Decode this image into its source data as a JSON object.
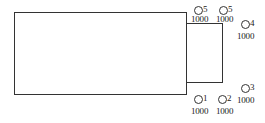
{
  "diagram": {
    "rectangles": [
      {
        "name": "main-block",
        "x": 14,
        "y": 12,
        "w": 173,
        "h": 83
      },
      {
        "name": "side-block",
        "x": 186,
        "y": 23,
        "w": 37,
        "h": 60
      }
    ],
    "markers": [
      {
        "id": "5",
        "value": "1000",
        "cx": 198,
        "cy": 10,
        "vx": 191,
        "vy": 15
      },
      {
        "id": "5",
        "value": "1000",
        "cx": 223,
        "cy": 10,
        "vx": 216,
        "vy": 15
      },
      {
        "id": "4",
        "value": "1000",
        "cx": 245,
        "cy": 24,
        "vx": 237,
        "vy": 32
      },
      {
        "id": "3",
        "value": "1000",
        "cx": 245,
        "cy": 88,
        "vx": 237,
        "vy": 96
      },
      {
        "id": "1",
        "value": "1000",
        "cx": 198,
        "cy": 99,
        "vx": 191,
        "vy": 107
      },
      {
        "id": "2",
        "value": "1000",
        "cx": 222,
        "cy": 99,
        "vx": 216,
        "vy": 107
      }
    ]
  }
}
